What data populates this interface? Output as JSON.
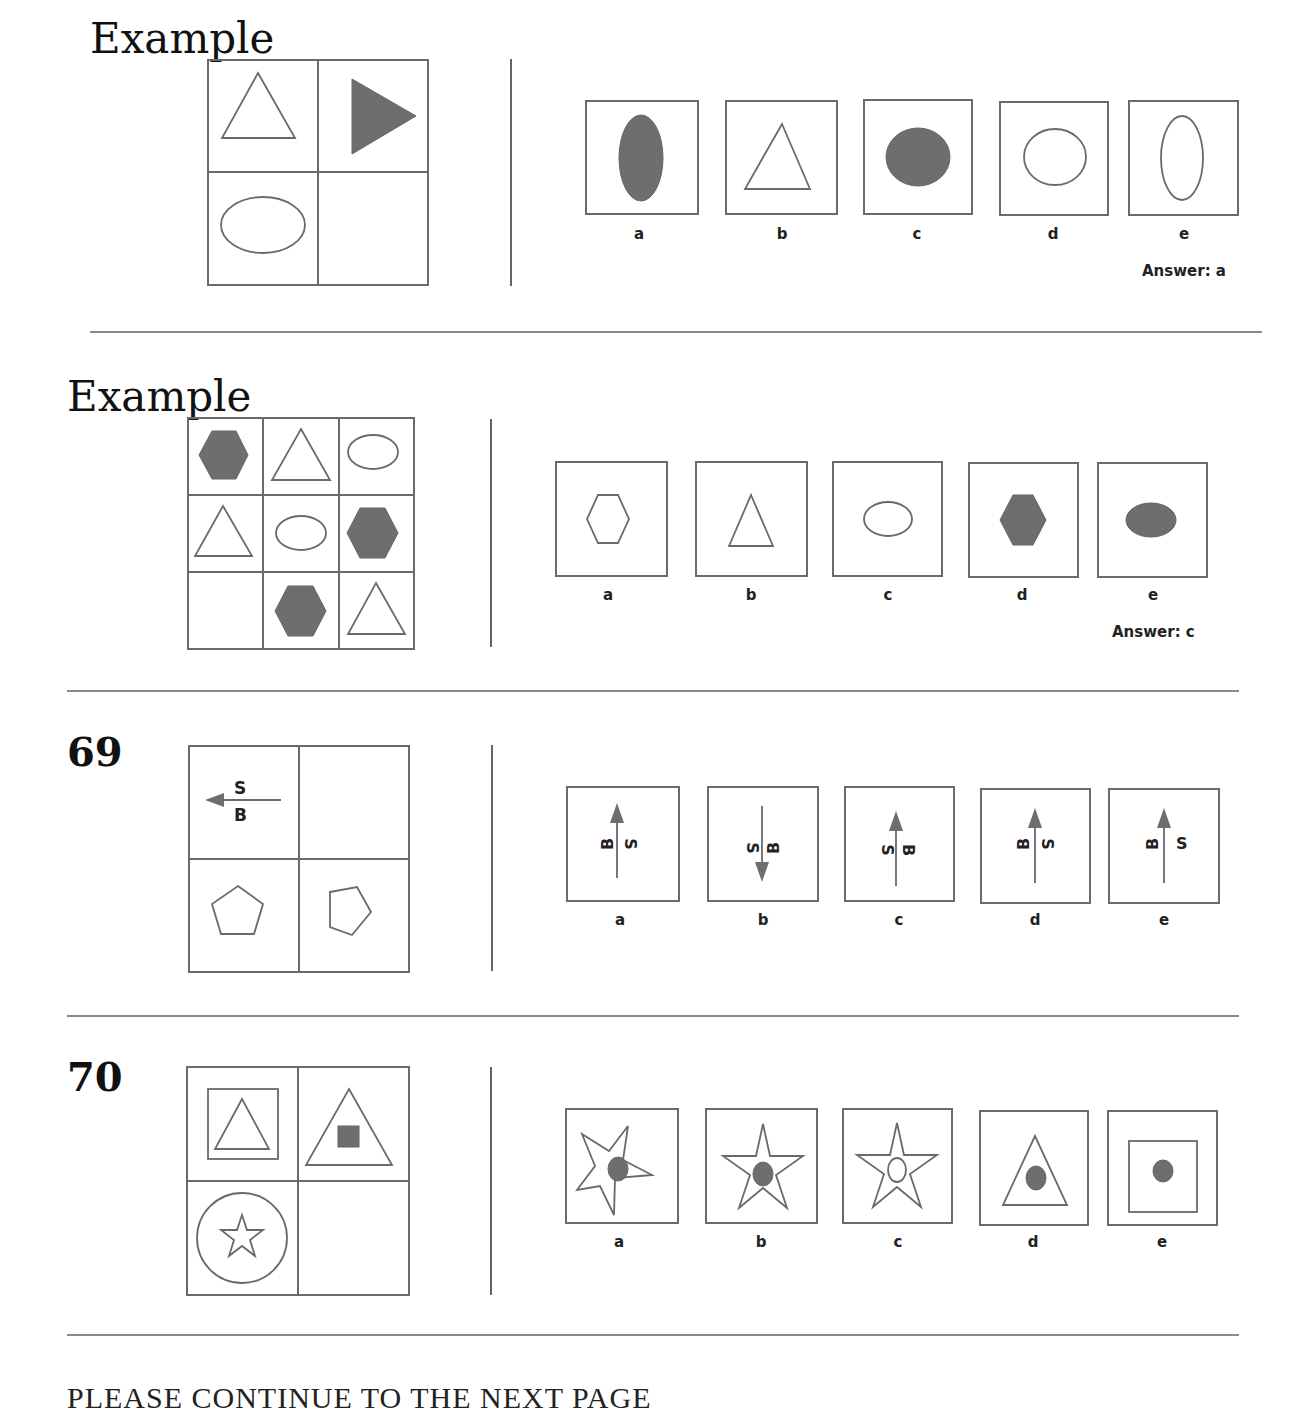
{
  "colors": {
    "stroke": "#6a6a6a",
    "fill": "#6e6e6e",
    "text": "#222222"
  },
  "sections": [
    {
      "id": "example1",
      "heading": "Example",
      "matrix": {
        "rows": 2,
        "cols": 2,
        "cells": [
          "open triangle (up)",
          "filled triangle (right)",
          "open ellipse (horizontal)",
          "empty"
        ]
      },
      "option_labels": [
        "a",
        "b",
        "c",
        "d",
        "e"
      ],
      "options": [
        "filled ellipse (vertical)",
        "open triangle (up)",
        "filled ellipse (horizontal)",
        "open ellipse (horizontal)",
        "open ellipse (vertical)"
      ],
      "answer": "Answer: a"
    },
    {
      "id": "example2",
      "heading": "Example",
      "matrix": {
        "rows": 3,
        "cols": 3,
        "cells": [
          "filled hexagon",
          "open triangle",
          "open ellipse",
          "open triangle",
          "open ellipse",
          "filled hexagon",
          "empty",
          "filled hexagon",
          "open triangle"
        ]
      },
      "option_labels": [
        "a",
        "b",
        "c",
        "d",
        "e"
      ],
      "options": [
        "open hexagon",
        "open triangle",
        "open ellipse",
        "filled hexagon",
        "filled ellipse"
      ],
      "answer": "Answer: c"
    },
    {
      "id": "q69",
      "heading": "69",
      "matrix": {
        "rows": 2,
        "cols": 2,
        "cells": [
          "arrow left with S above and B below",
          "empty",
          "pentagon (upright)",
          "pentagon (rotated)"
        ]
      },
      "arrow_letters": {
        "s": "S",
        "b": "B"
      },
      "option_labels": [
        "a",
        "b",
        "c",
        "d",
        "e"
      ],
      "options": [
        "arrow up, B left, S right (rotated)",
        "arrow down, S left, B right (rotated)",
        "arrow up, S left, B right (rotated)",
        "arrow up, B left, S right (rotated)",
        "arrow up, B left (rotated), S right (upright)"
      ]
    },
    {
      "id": "q70",
      "heading": "70",
      "matrix": {
        "rows": 2,
        "cols": 2,
        "cells": [
          "square containing open triangle",
          "triangle containing filled square",
          "circle containing open star",
          "empty"
        ]
      },
      "option_labels": [
        "a",
        "b",
        "c",
        "d",
        "e"
      ],
      "options": [
        "tilted star with filled circle",
        "star with filled circle",
        "star with open circle",
        "triangle with filled circle",
        "square with filled circle"
      ]
    }
  ],
  "footer": "PLEASE CONTINUE TO THE NEXT PAGE"
}
